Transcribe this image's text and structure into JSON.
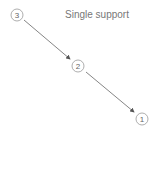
{
  "title": "Single support",
  "colors": {
    "stroke": "#999999",
    "arrow": "#555555",
    "text": "#777777"
  },
  "nodes": [
    {
      "id": "3",
      "label": "3",
      "cx": 17,
      "cy": 15
    },
    {
      "id": "2",
      "label": "2",
      "cx": 78,
      "cy": 66
    },
    {
      "id": "1",
      "label": "1",
      "cx": 142,
      "cy": 119
    }
  ],
  "edges": [
    {
      "from": "3",
      "to": "2"
    },
    {
      "from": "2",
      "to": "1"
    }
  ]
}
